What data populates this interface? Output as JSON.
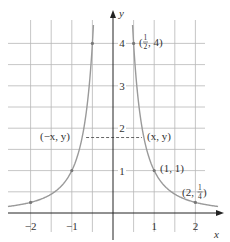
{
  "chart_data": {
    "type": "line",
    "title": "",
    "function": "y = 1/x^2",
    "xlabel": "x",
    "ylabel": "y",
    "xlim": [
      -2.4,
      2.5
    ],
    "ylim": [
      0,
      4.3
    ],
    "grid": true,
    "grid_step": 0.5,
    "x_ticks": [
      -2,
      -1,
      1,
      2
    ],
    "x_tick_labels": [
      "−2",
      "−1",
      "1",
      "2"
    ],
    "y_ticks": [
      1,
      2,
      3,
      4
    ],
    "y_tick_labels": [
      "1",
      "2",
      "3",
      "4"
    ],
    "series": [
      {
        "name": "y = 1/x² (left branch)",
        "x": [
          -2.4,
          -2,
          -1.5,
          -1,
          -0.75,
          -0.6,
          -0.5,
          -0.48
        ],
        "y": [
          0.174,
          0.25,
          0.444,
          1,
          1.778,
          2.778,
          4,
          4.34
        ]
      },
      {
        "name": "y = 1/x² (right branch)",
        "x": [
          0.48,
          0.5,
          0.6,
          0.75,
          1,
          1.5,
          2,
          2.5
        ],
        "y": [
          4.34,
          4,
          2.778,
          1.778,
          1,
          0.444,
          0.25,
          0.16
        ]
      }
    ],
    "points": [
      {
        "x": 0.5,
        "y": 4,
        "label": "(1/2, 4)"
      },
      {
        "x": -0.5,
        "y": 4,
        "label": ""
      },
      {
        "x": 1,
        "y": 1,
        "label": "(1, 1)"
      },
      {
        "x": -1,
        "y": 1,
        "label": ""
      },
      {
        "x": 2,
        "y": 0.25,
        "label": "(2, 1/4)"
      },
      {
        "x": -2,
        "y": 0.25,
        "label": ""
      }
    ],
    "annotations": [
      {
        "text": "(−x, y)",
        "x": -0.75,
        "y": 1.78
      },
      {
        "text": "(x, y)",
        "x": 0.75,
        "y": 1.78
      },
      {
        "type": "dashed-segment",
        "from": [
          -0.75,
          1.78
        ],
        "to": [
          0.75,
          1.78
        ]
      }
    ]
  },
  "labels": {
    "x_axis": "x",
    "y_axis": "y",
    "pt_half4_open": "(",
    "pt_half4_close": ", 4)",
    "pt_half_num": "1",
    "pt_half_den": "2",
    "pt_11": "(1, 1)",
    "pt_2q_open": "(2, ",
    "pt_2q_close": ")",
    "pt_q_num": "1",
    "pt_q_den": "4",
    "neg_xy": "(−x, y)",
    "pos_xy": "(x, y)"
  },
  "colors": {
    "grid": "#b8b8b8",
    "axis": "#222222",
    "curve": "#9a9a9a",
    "dash": "#555555",
    "text": "#333333"
  }
}
